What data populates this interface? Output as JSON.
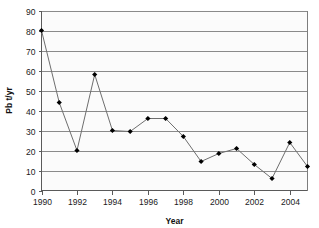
{
  "chart_data": {
    "type": "line",
    "title": "",
    "xlabel": "Year",
    "ylabel": "Pb t/yr",
    "x": [
      1990,
      1991,
      1992,
      1993,
      1994,
      1995,
      1996,
      1997,
      1998,
      1999,
      2000,
      2001,
      2002,
      2003,
      2004,
      2005
    ],
    "values": [
      80,
      44,
      20,
      58,
      30,
      29.5,
      36,
      36,
      27,
      14.5,
      18.5,
      21,
      13,
      6,
      24,
      12
    ],
    "series": [
      {
        "name": "Pb t/yr",
        "values": [
          80,
          44,
          20,
          58,
          30,
          29.5,
          36,
          36,
          27,
          14.5,
          18.5,
          21,
          13,
          6,
          24,
          12
        ]
      }
    ],
    "xlim": [
      1990,
      2005
    ],
    "ylim": [
      0,
      90
    ],
    "y_ticks": [
      0,
      10,
      20,
      30,
      40,
      50,
      60,
      70,
      80,
      90
    ],
    "y_tick_labels": [
      "0",
      "10",
      "20",
      "30",
      "40",
      "50",
      "60",
      "70",
      "80",
      "90"
    ],
    "x_ticks": [
      1990,
      1992,
      1994,
      1996,
      1998,
      2000,
      2002,
      2004
    ],
    "x_tick_labels": [
      "1990",
      "1992",
      "1994",
      "1996",
      "1998",
      "2000",
      "2002",
      "2004"
    ],
    "grid": true,
    "grid_axis": "y",
    "legend": false,
    "legend_position": "none",
    "marker": "diamond",
    "marker_color": "#000000",
    "line_color": "#6e6e6e",
    "grid_color": "#8a8a8a",
    "plot_background": "#fbfbfb",
    "figure_background": "#ffffff"
  }
}
